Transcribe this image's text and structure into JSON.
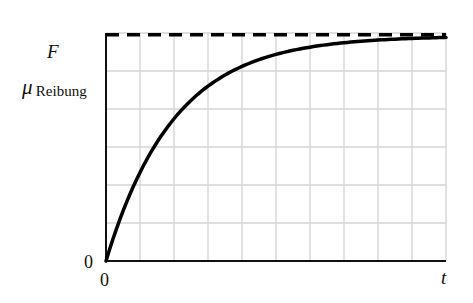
{
  "chart_data": {
    "type": "line",
    "title": "",
    "xlabel": "t",
    "ylabel": "F",
    "y_reference_label": {
      "symbol": "μ",
      "subscript": "Reibung"
    },
    "x_tick_labels": [
      "0"
    ],
    "y_tick_labels": [
      "0"
    ],
    "xlim": [
      0,
      10
    ],
    "ylim": [
      0,
      6.2
    ],
    "grid": true,
    "grid_columns": 10,
    "grid_rows": 6,
    "legend": null,
    "series": [
      {
        "name": "F(t)",
        "style": "solid",
        "description": "Exponential saturation curve rising from 0 toward μ_Reibung",
        "x": [
          0,
          0.5,
          1,
          1.5,
          2,
          2.5,
          3,
          3.5,
          4,
          5,
          6,
          7,
          8,
          9,
          10
        ],
        "values": [
          0,
          1.24,
          2.23,
          3.03,
          3.67,
          4.18,
          4.59,
          4.92,
          5.18,
          5.55,
          5.79,
          5.93,
          6.02,
          6.07,
          6.1
        ]
      },
      {
        "name": "μ_Reibung",
        "style": "dashed",
        "description": "Horizontal asymptote",
        "x": [
          0,
          10
        ],
        "values": [
          6.15,
          6.15
        ]
      }
    ],
    "annotations": [
      "F",
      "μ_Reibung",
      "0",
      "0",
      "t"
    ]
  },
  "labels": {
    "y_axis": "F",
    "mu": "μ",
    "mu_sub": "Reibung",
    "origin_y": "0",
    "origin_x": "0",
    "x_axis": "t"
  },
  "colors": {
    "curve": "#000000",
    "grid": "#d4d4d4",
    "axis": "#111111",
    "background": "#ffffff"
  }
}
